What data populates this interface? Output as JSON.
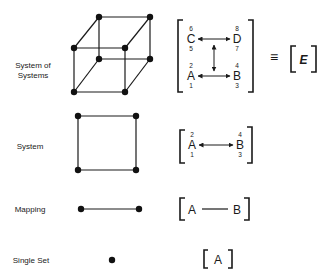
{
  "rows": [
    {
      "label_line1": "System of",
      "label_line2": "Systems",
      "matrix": {
        "top_left": {
          "letter": "C",
          "above": "6",
          "below": "5"
        },
        "top_right": {
          "letter": "D",
          "above": "8",
          "below": "7"
        },
        "bottom_left": {
          "letter": "A",
          "above": "2",
          "below": "1"
        },
        "bottom_right": {
          "letter": "B",
          "above": "4",
          "below": "3"
        }
      },
      "equivalence_symbol": "≡",
      "result": "E"
    },
    {
      "label": "System",
      "matrix": {
        "left": {
          "letter": "A",
          "above": "2",
          "below": "1"
        },
        "right": {
          "letter": "B",
          "above": "4",
          "below": "3"
        }
      }
    },
    {
      "label": "Mapping",
      "matrix": {
        "left": "A",
        "right": "B"
      }
    },
    {
      "label": "Single Set",
      "matrix": {
        "only": "A"
      }
    }
  ],
  "colors": {
    "ink": "#1a1a1a",
    "background": "#ffffff"
  }
}
